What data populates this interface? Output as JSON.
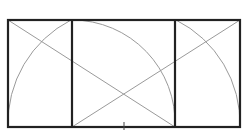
{
  "diagram": {
    "type": "geometric-construction",
    "colors": {
      "background": "#ffffff",
      "frame": "#222222",
      "construction": "#9a9a9a"
    },
    "frame": {
      "x": 8,
      "y": 20,
      "width": 232,
      "height": 107
    },
    "dividers": [
      {
        "x": 72,
        "y1": 20,
        "y2": 127
      },
      {
        "x": 175,
        "y1": 20,
        "y2": 127
      }
    ],
    "diagonals": [
      {
        "x1": 8,
        "y1": 20,
        "x2": 175,
        "y2": 127
      },
      {
        "x1": 72,
        "y1": 127,
        "x2": 240,
        "y2": 20
      }
    ],
    "arcs": [
      {
        "name": "left-arc",
        "cx": 124,
        "cy": 127,
        "r": 116,
        "from": [
          8,
          127
        ],
        "to": [
          71,
          20
        ]
      },
      {
        "name": "right-arc",
        "cx": 124,
        "cy": 127,
        "r": 116,
        "from": [
          176,
          20
        ],
        "to": [
          240,
          127
        ]
      },
      {
        "name": "middle-arc",
        "cx": 72,
        "cy": 127,
        "r": 103,
        "from": [
          72,
          20
        ],
        "to": [
          175,
          127
        ]
      }
    ],
    "center_tick": {
      "x": 124,
      "y1": 122,
      "y2": 130
    },
    "intersection": {
      "x": 124,
      "y": 92
    }
  }
}
